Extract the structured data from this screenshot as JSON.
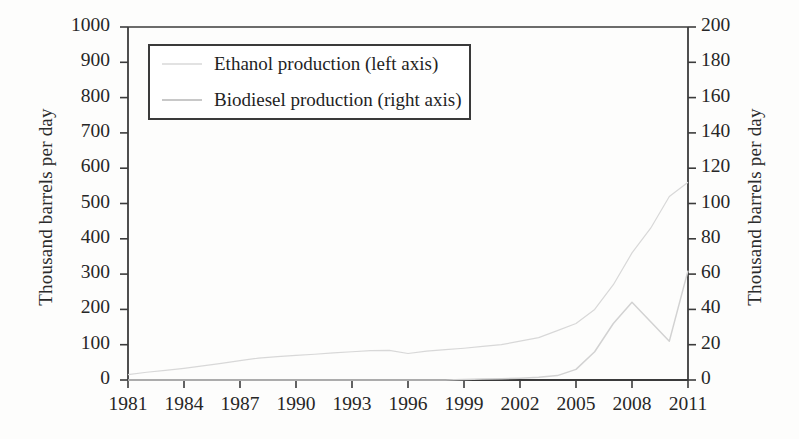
{
  "chart_data": {
    "type": "line",
    "title": "",
    "xlabel": "",
    "ylabel": "Thousand barrels per day",
    "ylabel_right": "Thousand barrels per day",
    "xlim": [
      1981,
      2011
    ],
    "ylim": [
      0,
      1000
    ],
    "ylim_right": [
      0,
      200
    ],
    "grid": false,
    "legend_position": "upper-left",
    "xticks": [
      "1981",
      "1984",
      "1987",
      "1990",
      "1993",
      "1996",
      "1999",
      "2002",
      "2005",
      "2008",
      "2011"
    ],
    "yticks_left": [
      "0",
      "100",
      "200",
      "300",
      "400",
      "500",
      "600",
      "700",
      "800",
      "900",
      "1000"
    ],
    "yticks_right": [
      "0",
      "20",
      "40",
      "60",
      "80",
      "100",
      "120",
      "140",
      "160",
      "180",
      "200"
    ],
    "x": [
      1981,
      1982,
      1983,
      1984,
      1985,
      1986,
      1987,
      1988,
      1989,
      1990,
      1991,
      1992,
      1993,
      1994,
      1995,
      1996,
      1997,
      1998,
      1999,
      2000,
      2001,
      2002,
      2003,
      2004,
      2005,
      2006,
      2007,
      2008,
      2009,
      2010,
      2011
    ],
    "series": [
      {
        "name": "Ethanol production (left axis)",
        "axis": "left",
        "color": "#d8d8d8",
        "values": [
          15,
          22,
          27,
          33,
          40,
          47,
          55,
          62,
          66,
          70,
          73,
          77,
          80,
          83,
          84,
          75,
          82,
          86,
          90,
          95,
          100,
          110,
          120,
          140,
          160,
          200,
          270,
          360,
          430,
          520,
          560
        ]
      },
      {
        "name": "Biodiesel production (right axis)",
        "axis": "right",
        "color": "#d2d2d2",
        "values": [
          0,
          0,
          0,
          0,
          0,
          0,
          0,
          0,
          0,
          0,
          0,
          0,
          0,
          0,
          0,
          0,
          0,
          0,
          0.3,
          0.5,
          0.7,
          1,
          1.5,
          2.5,
          6,
          16,
          32,
          44,
          33,
          22,
          62
        ]
      }
    ]
  },
  "legend": {
    "entries": [
      {
        "label": "Ethanol production (left axis)",
        "color": "#e2e2e2"
      },
      {
        "label": "Biodiesel production (right axis)",
        "color": "#c8c8c8"
      }
    ]
  },
  "axes": {
    "frame_color": "#3b3b3b"
  }
}
